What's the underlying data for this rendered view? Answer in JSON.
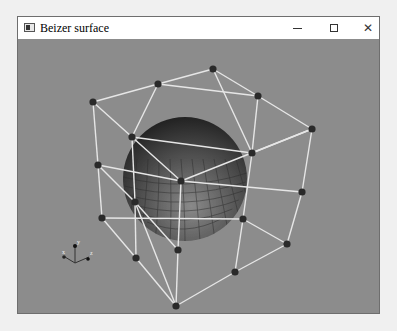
{
  "window": {
    "title": "Beizer surface",
    "controls": {
      "minimize": "minimize",
      "maximize": "maximize",
      "close": "close"
    }
  },
  "viewport": {
    "background": "#8c8c8c",
    "wire_color": "#e6e6e6",
    "point_color": "#2a2a2a",
    "sphere": {
      "cx": 185,
      "cy": 178,
      "r": 62
    },
    "control_points": [
      [
        93,
        101
      ],
      [
        158,
        83
      ],
      [
        213,
        68
      ],
      [
        258,
        95
      ],
      [
        312,
        128
      ],
      [
        98,
        164
      ],
      [
        132,
        136
      ],
      [
        181,
        180
      ],
      [
        252,
        152
      ],
      [
        302,
        191
      ],
      [
        102,
        217
      ],
      [
        135,
        201
      ],
      [
        243,
        218
      ],
      [
        287,
        243
      ],
      [
        136,
        257
      ],
      [
        178,
        249
      ],
      [
        235,
        271
      ],
      [
        176,
        305
      ]
    ],
    "edges": [
      [
        0,
        1
      ],
      [
        1,
        2
      ],
      [
        2,
        3
      ],
      [
        3,
        4
      ],
      [
        0,
        6
      ],
      [
        6,
        7
      ],
      [
        7,
        4
      ],
      [
        1,
        3
      ],
      [
        6,
        8
      ],
      [
        8,
        4
      ],
      [
        0,
        5
      ],
      [
        5,
        10
      ],
      [
        6,
        11
      ],
      [
        11,
        15
      ],
      [
        7,
        15
      ],
      [
        4,
        9
      ],
      [
        9,
        13
      ],
      [
        5,
        7
      ],
      [
        7,
        9
      ],
      [
        10,
        12
      ],
      [
        12,
        13
      ],
      [
        10,
        14
      ],
      [
        14,
        17
      ],
      [
        15,
        17
      ],
      [
        11,
        17
      ],
      [
        12,
        16
      ],
      [
        16,
        17
      ],
      [
        13,
        16
      ],
      [
        2,
        8
      ],
      [
        3,
        8
      ],
      [
        8,
        12
      ],
      [
        11,
        14
      ],
      [
        5,
        11
      ],
      [
        1,
        6
      ]
    ],
    "axes_gizmo": {
      "x": 75,
      "y": 262,
      "labels": [
        "x",
        "y",
        "z"
      ]
    }
  }
}
